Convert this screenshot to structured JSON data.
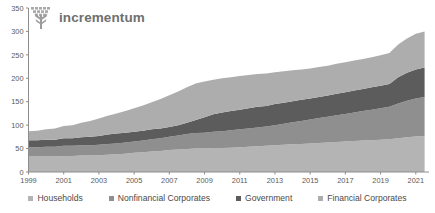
{
  "brand": {
    "name": "incrementum",
    "logo_icon": "tree-icon",
    "color": "#6f6f6f"
  },
  "chart_data": {
    "type": "area",
    "stacked": true,
    "title": "",
    "subtitle": "",
    "xlabel": "",
    "ylabel": "",
    "grid": false,
    "legend_position": "bottom",
    "xlim": [
      1999,
      2021.75
    ],
    "ylim": [
      0,
      350
    ],
    "yticks": [
      0,
      50,
      100,
      150,
      200,
      250,
      300,
      350
    ],
    "xticks": [
      1999,
      2001,
      2003,
      2005,
      2007,
      2009,
      2011,
      2013,
      2015,
      2017,
      2019,
      2021
    ],
    "x": [
      1999,
      1999.5,
      2000,
      2000.5,
      2001,
      2001.5,
      2002,
      2002.5,
      2003,
      2003.5,
      2004,
      2004.5,
      2005,
      2005.5,
      2006,
      2006.5,
      2007,
      2007.5,
      2008,
      2008.5,
      2009,
      2009.5,
      2010,
      2010.5,
      2011,
      2011.5,
      2012,
      2012.5,
      2013,
      2013.5,
      2014,
      2014.5,
      2015,
      2015.5,
      2016,
      2016.5,
      2017,
      2017.5,
      2018,
      2018.5,
      2019,
      2019.5,
      2020,
      2020.5,
      2021,
      2021.5
    ],
    "series": [
      {
        "name": "Households",
        "color": "#b4b4b4",
        "values": [
          33,
          33,
          33,
          33,
          34,
          34,
          35,
          35,
          36,
          37,
          38,
          39,
          41,
          42,
          44,
          45,
          47,
          48,
          49,
          50,
          50,
          51,
          51,
          52,
          53,
          54,
          55,
          56,
          57,
          58,
          59,
          60,
          61,
          62,
          63,
          64,
          65,
          66,
          67,
          68,
          69,
          70,
          72,
          74,
          76,
          77
        ]
      },
      {
        "name": "Nonfinancial Corporates",
        "color": "#8f8f8f",
        "values": [
          20,
          20,
          21,
          21,
          22,
          22,
          22,
          22,
          22,
          23,
          23,
          24,
          24,
          25,
          26,
          27,
          28,
          30,
          32,
          33,
          34,
          35,
          36,
          37,
          38,
          39,
          40,
          41,
          43,
          45,
          47,
          49,
          51,
          53,
          55,
          57,
          59,
          61,
          63,
          65,
          67,
          69,
          74,
          78,
          81,
          83
        ]
      },
      {
        "name": "Government",
        "color": "#5c5c5c",
        "values": [
          15,
          15,
          15,
          15,
          16,
          16,
          17,
          18,
          19,
          20,
          21,
          21,
          21,
          21,
          21,
          21,
          21,
          22,
          24,
          28,
          33,
          37,
          40,
          41,
          42,
          43,
          44,
          44,
          45,
          45,
          45,
          45,
          45,
          45,
          45,
          46,
          46,
          47,
          47,
          48,
          48,
          49,
          56,
          60,
          62,
          63
        ]
      },
      {
        "name": "Financial Corporates",
        "color": "#adadad",
        "values": [
          19,
          20,
          22,
          24,
          26,
          28,
          31,
          34,
          37,
          40,
          43,
          46,
          50,
          54,
          58,
          63,
          68,
          72,
          76,
          78,
          76,
          74,
          73,
          72,
          72,
          71,
          70,
          69,
          68,
          67,
          66,
          65,
          64,
          64,
          64,
          64,
          64,
          64,
          64,
          64,
          65,
          66,
          70,
          73,
          76,
          77
        ]
      }
    ],
    "totals_note": ""
  },
  "legend": {
    "items": [
      {
        "label": "Households",
        "color": "#b4b4b4"
      },
      {
        "label": "Nonfinancial Corporates",
        "color": "#8f8f8f"
      },
      {
        "label": "Government",
        "color": "#5c5c5c"
      },
      {
        "label": "Financial Corporates",
        "color": "#adadad"
      }
    ]
  }
}
